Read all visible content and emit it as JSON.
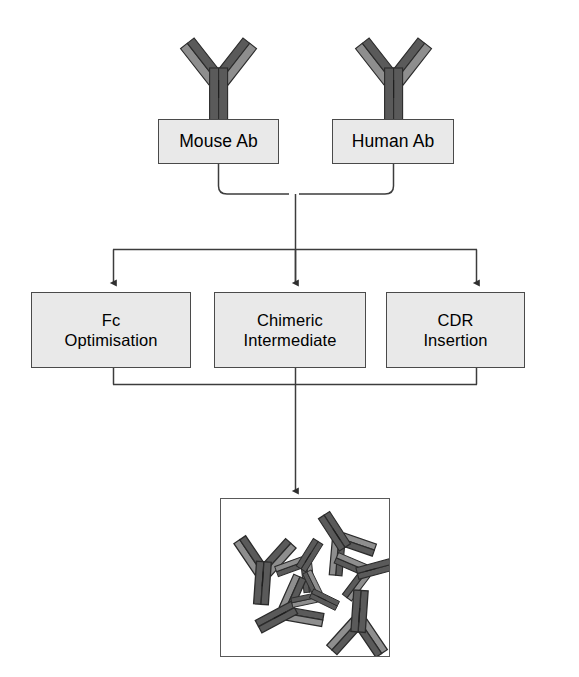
{
  "diagram": {
    "background_color": "#ffffff",
    "box_fill_color": "#e9e9e9",
    "box_border_color": "#4a4a4a",
    "line_color": "#3c3c3c",
    "antibody_heavy_chain_color": "#545454",
    "antibody_light_chain_color": "#8e8e8e",
    "antibody_outline_color": "#2b2b2b",
    "product_panel_fill": "#ffffff",
    "product_panel_border": "#595959"
  },
  "nodes": {
    "source_row": [
      {
        "id": "mouse-ab",
        "label": "Mouse Ab",
        "x": 158,
        "y": 119,
        "width": 121,
        "height": 45,
        "icon": "antibody-icon"
      },
      {
        "id": "human-ab",
        "label": "Human Ab",
        "x": 332,
        "y": 119,
        "width": 122,
        "height": 45,
        "icon": "antibody-icon"
      }
    ],
    "process_row": [
      {
        "id": "fc-optimisation",
        "label": "Fc\nOptimisation",
        "x": 31,
        "y": 292,
        "width": 160,
        "height": 76
      },
      {
        "id": "chimeric-intermediate",
        "label": "Chimeric\nIntermediate",
        "x": 214,
        "y": 292,
        "width": 152,
        "height": 76
      },
      {
        "id": "cdr-insertion",
        "label": "CDR\nInsertion",
        "x": 386,
        "y": 292,
        "width": 139,
        "height": 76
      }
    ],
    "product": {
      "id": "humanised-antibody-pool",
      "label": "",
      "x": 220,
      "y": 498,
      "width": 170,
      "height": 159,
      "icon": "antibody-cluster-icon",
      "antibody_count": 7
    }
  },
  "source_antibody_icons": [
    {
      "id": "mouse-ab-icon",
      "cx": 218,
      "cy": 75,
      "rotation": 0
    },
    {
      "id": "human-ab-icon",
      "cx": 393,
      "cy": 75,
      "rotation": 0
    }
  ],
  "product_antibody_icons": [
    {
      "id": "product-ab-1",
      "cx": 262,
      "cy": 573,
      "rotation": 4,
      "scale": 0.82
    },
    {
      "id": "product-ab-2",
      "cx": 338,
      "cy": 537,
      "rotation": 147,
      "scale": 0.74
    },
    {
      "id": "product-ab-3",
      "cx": 305,
      "cy": 560,
      "rotation": 212,
      "scale": 0.62
    },
    {
      "id": "product-ab-4",
      "cx": 366,
      "cy": 570,
      "rotation": 255,
      "scale": 0.66
    },
    {
      "id": "product-ab-5",
      "cx": 283,
      "cy": 612,
      "rotation": 62,
      "scale": 0.78
    },
    {
      "id": "product-ab-6",
      "cx": 358,
      "cy": 619,
      "rotation": 184,
      "scale": 0.8
    },
    {
      "id": "product-ab-7",
      "cx": 318,
      "cy": 596,
      "rotation": 296,
      "scale": 0.55
    }
  ],
  "edges": [
    {
      "id": "brace-sources-to-trunk",
      "type": "brace-merge",
      "from": [
        "mouse-ab",
        "human-ab"
      ],
      "to": "distribution-bar"
    },
    {
      "id": "trunk-to-distribution-bar",
      "type": "line",
      "arrowhead": false
    },
    {
      "id": "distribution-bar",
      "type": "horizontal-bar"
    },
    {
      "id": "arrow-to-fc-optimisation",
      "type": "arrow",
      "arrowhead": true,
      "to": "fc-optimisation"
    },
    {
      "id": "arrow-to-chimeric-intermediate",
      "type": "arrow",
      "arrowhead": true,
      "to": "chimeric-intermediate"
    },
    {
      "id": "arrow-to-cdr-insertion",
      "type": "arrow",
      "arrowhead": true,
      "to": "cdr-insertion"
    },
    {
      "id": "collector-bar-process-row",
      "type": "horizontal-bar"
    },
    {
      "id": "arrow-to-product-panel",
      "type": "arrow",
      "arrowhead": true,
      "to": "humanised-antibody-pool"
    }
  ]
}
